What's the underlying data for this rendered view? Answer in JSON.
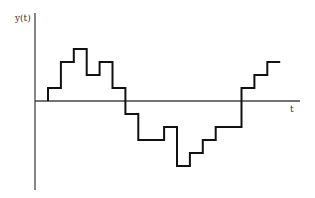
{
  "chart_data": {
    "type": "line",
    "subtype": "step",
    "title": "",
    "xlabel": "t",
    "ylabel": "y(t)",
    "grid": false,
    "legend": null,
    "axis_color": "#444444",
    "line_color": "#111111",
    "zero_level": 0,
    "step_units": "unlabeled (arbitrary quantization steps)",
    "x": [
      0,
      1,
      2,
      3,
      4,
      5,
      6,
      7,
      8,
      9,
      10,
      11,
      12,
      13,
      14,
      15,
      16,
      17
    ],
    "values": [
      1,
      3,
      4,
      2,
      3,
      1,
      -1,
      -3,
      -3,
      -2,
      -5,
      -4,
      -3,
      -2,
      -2,
      1,
      2,
      3
    ],
    "segments": [
      {
        "level": 1,
        "width": 1
      },
      {
        "level": 3,
        "width": 1
      },
      {
        "level": 4,
        "width": 1
      },
      {
        "level": 2,
        "width": 1
      },
      {
        "level": 3,
        "width": 1
      },
      {
        "level": 1,
        "width": 1
      },
      {
        "level": -1,
        "width": 1
      },
      {
        "level": -3,
        "width": 2
      },
      {
        "level": -2,
        "width": 1
      },
      {
        "level": -5,
        "width": 1
      },
      {
        "level": -4,
        "width": 1
      },
      {
        "level": -3,
        "width": 1
      },
      {
        "level": -2,
        "width": 2
      },
      {
        "level": 1,
        "width": 1
      },
      {
        "level": 2,
        "width": 1
      },
      {
        "level": 3,
        "width": 1
      }
    ]
  },
  "labels": {
    "y_axis": "y(t)",
    "t_axis": "t"
  }
}
